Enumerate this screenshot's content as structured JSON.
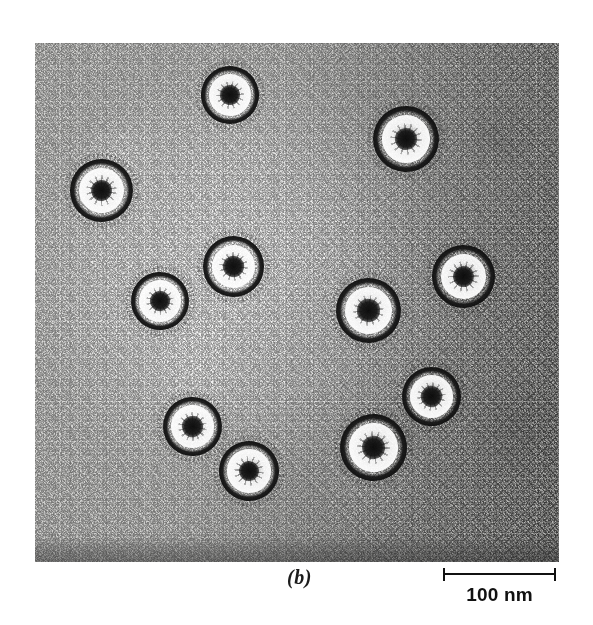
{
  "figure": {
    "panel_label": "(b)",
    "modality": "transmission-electron-micrograph"
  },
  "scale": {
    "label": "100 nm",
    "value": 100,
    "unit": "nm",
    "bar_length_px": 113,
    "nm_per_px": 0.885
  },
  "micrograph": {
    "left": 35,
    "top": 43,
    "width": 524,
    "height": 519,
    "background_tone": "#cfcfcd",
    "grain": "heavy photographic grain, brighter toward centre-left, darker toward right edge",
    "particle_count": 11
  },
  "particles": [
    {
      "id": "particle-1",
      "cx": 230,
      "cy": 95,
      "d": 58,
      "rot": 12
    },
    {
      "id": "particle-2",
      "cx": 406,
      "cy": 139,
      "d": 66,
      "rot": 47
    },
    {
      "id": "particle-3",
      "cx": 101,
      "cy": 190,
      "d": 63,
      "rot": 80
    },
    {
      "id": "particle-4",
      "cx": 233,
      "cy": 266,
      "d": 61,
      "rot": 23
    },
    {
      "id": "particle-5",
      "cx": 160,
      "cy": 301,
      "d": 58,
      "rot": 131
    },
    {
      "id": "particle-6",
      "cx": 463,
      "cy": 276,
      "d": 63,
      "rot": 66
    },
    {
      "id": "particle-7",
      "cx": 368,
      "cy": 310,
      "d": 65,
      "rot": 9
    },
    {
      "id": "particle-8",
      "cx": 192,
      "cy": 426,
      "d": 59,
      "rot": 155
    },
    {
      "id": "particle-9",
      "cx": 249,
      "cy": 471,
      "d": 60,
      "rot": 98
    },
    {
      "id": "particle-10",
      "cx": 431,
      "cy": 396,
      "d": 59,
      "rot": 34
    },
    {
      "id": "particle-11",
      "cx": 373,
      "cy": 447,
      "d": 67,
      "rot": 72
    }
  ]
}
